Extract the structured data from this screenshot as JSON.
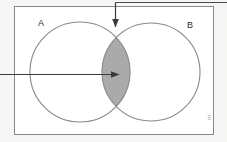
{
  "figure": {
    "background_color": "#f6f6f5",
    "interior_color": "#ffffff",
    "stroke_color": "#888888",
    "shade_color": "#aaaaaa",
    "arrow_color": "#3a3a3a",
    "corner_glyph": "ш"
  },
  "universe": {
    "name": "universal-set-rectangle",
    "x": 14,
    "y": 6,
    "width": 200,
    "height": 129
  },
  "sets": [
    {
      "label": "A",
      "name": "set-a-circle",
      "cx": 80,
      "cy": 72,
      "r": 50,
      "label_x": 38,
      "label_y": 26
    },
    {
      "label": "B",
      "name": "set-b-circle",
      "cx": 151,
      "cy": 72,
      "r": 49,
      "label_x": 187,
      "label_y": 28
    }
  ],
  "shaded_region": {
    "name": "intersection-lens",
    "description": "A intersect B",
    "fill": "#aaaaaa"
  },
  "annotations": [
    {
      "name": "top-pointer-arrow",
      "orientation": "vertical-down",
      "from_x": 115,
      "from_y": 2,
      "to_x": 115,
      "to_y": 27,
      "leader_from_x": 115,
      "leader_to_x": 227,
      "leader_y": 2
    },
    {
      "name": "left-pointer-arrow",
      "orientation": "horizontal-right",
      "from_x": 0,
      "from_y": 74,
      "to_x": 119,
      "to_y": 74
    }
  ],
  "chart_data": {
    "type": "diagram",
    "diagram_type": "venn",
    "set_labels": [
      "A",
      "B"
    ],
    "regions": [
      {
        "id": "A_only",
        "label": "A only",
        "shaded": false
      },
      {
        "id": "A_and_B",
        "label": "A ∩ B",
        "shaded": true
      },
      {
        "id": "B_only",
        "label": "B only",
        "shaded": false
      },
      {
        "id": "outside",
        "label": "Universe minus (A ∪ B)",
        "shaded": false
      }
    ],
    "highlighted_region": "A_and_B",
    "pointer_count": 2,
    "grid": false,
    "legend": "none"
  }
}
